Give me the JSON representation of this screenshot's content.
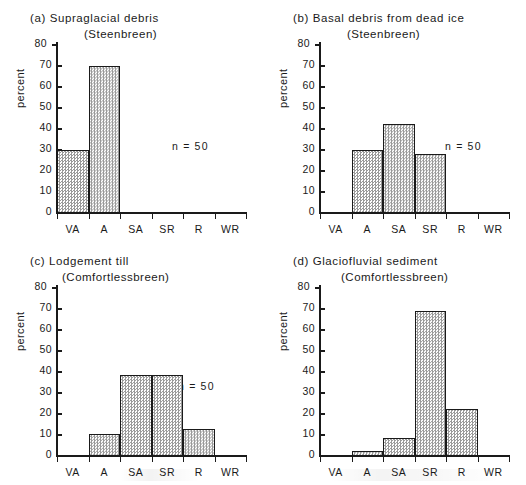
{
  "figure": {
    "axis": {
      "ylabel": "percent",
      "yticks": [
        0,
        10,
        20,
        30,
        40,
        50,
        60,
        70,
        80
      ],
      "ylim": [
        0,
        80
      ],
      "categories": [
        "VA",
        "A",
        "SA",
        "SR",
        "R",
        "WR"
      ]
    },
    "panels": [
      {
        "id": "a",
        "tag": "(a)",
        "title": "(a)  Supraglacial debris",
        "subtitle": "(Steenbreen)",
        "n_label": "n = 50",
        "values": [
          30,
          70.2,
          0,
          0,
          0,
          0
        ]
      },
      {
        "id": "b",
        "tag": "(b)",
        "title": "(b)  Basal debris from dead ice",
        "subtitle": "(Steenbreen)",
        "n_label": "n = 50",
        "values": [
          0,
          30,
          42.5,
          28.2,
          0,
          0
        ]
      },
      {
        "id": "c",
        "tag": "(c)",
        "title": "(c)  Lodgement till",
        "subtitle": "(Comfortlessbreen)",
        "n_label": "n = 50",
        "values": [
          0,
          10.4,
          38.6,
          38.6,
          13.1,
          0
        ]
      },
      {
        "id": "d",
        "tag": "(d)",
        "title": "(d)  Glaciofluvial sediment",
        "subtitle": "(Comfortlessbreen)",
        "n_label": "n = 50",
        "values": [
          0,
          2.5,
          8.6,
          69.1,
          22.4,
          0
        ]
      }
    ]
  },
  "chart_data": [
    {
      "type": "bar",
      "title": "(a)  Supraglacial debris",
      "subtitle": "(Steenbreen)",
      "categories": [
        "VA",
        "A",
        "SA",
        "SR",
        "R",
        "WR"
      ],
      "values": [
        30,
        70.2,
        0,
        0,
        0,
        0
      ],
      "xlabel": "",
      "ylabel": "percent",
      "ylim": [
        0,
        80
      ],
      "yticks": [
        0,
        10,
        20,
        30,
        40,
        50,
        60,
        70,
        80
      ],
      "annotations": [
        "n = 50"
      ],
      "grid": false,
      "legend": "none"
    },
    {
      "type": "bar",
      "title": "(b)  Basal debris from dead ice",
      "subtitle": "(Steenbreen)",
      "categories": [
        "VA",
        "A",
        "SA",
        "SR",
        "R",
        "WR"
      ],
      "values": [
        0,
        30,
        42.5,
        28.2,
        0,
        0
      ],
      "xlabel": "",
      "ylabel": "percent",
      "ylim": [
        0,
        80
      ],
      "yticks": [
        0,
        10,
        20,
        30,
        40,
        50,
        60,
        70,
        80
      ],
      "annotations": [
        "n = 50"
      ],
      "grid": false,
      "legend": "none"
    },
    {
      "type": "bar",
      "title": "(c)  Lodgement till",
      "subtitle": "(Comfortlessbreen)",
      "categories": [
        "VA",
        "A",
        "SA",
        "SR",
        "R",
        "WR"
      ],
      "values": [
        0,
        10.4,
        38.6,
        38.6,
        13.1,
        0
      ],
      "xlabel": "",
      "ylabel": "percent",
      "ylim": [
        0,
        80
      ],
      "yticks": [
        0,
        10,
        20,
        30,
        40,
        50,
        60,
        70,
        80
      ],
      "annotations": [
        "n = 50"
      ],
      "grid": false,
      "legend": "none"
    },
    {
      "type": "bar",
      "title": "(d)  Glaciofluvial sediment",
      "subtitle": "(Comfortlessbreen)",
      "categories": [
        "VA",
        "A",
        "SA",
        "SR",
        "R",
        "WR"
      ],
      "values": [
        0,
        2.5,
        8.6,
        69.1,
        22.4,
        0
      ],
      "xlabel": "",
      "ylabel": "percent",
      "ylim": [
        0,
        80
      ],
      "yticks": [
        0,
        10,
        20,
        30,
        40,
        50,
        60,
        70,
        80
      ],
      "annotations": [
        "n = 50"
      ],
      "grid": false,
      "legend": "none"
    }
  ]
}
